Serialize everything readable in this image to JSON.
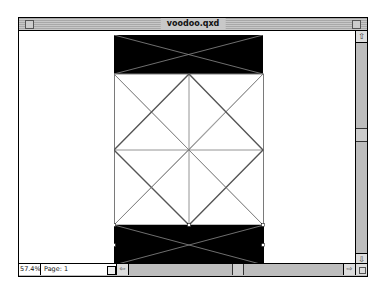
{
  "window": {
    "title": "voodoo.qxd"
  },
  "status_bar": {
    "zoom_level": "57.4%",
    "page_label": "Page: 1"
  },
  "scrollbars": {
    "vertical": {
      "up_arrow": "⇧",
      "down_arrow": "⇩"
    },
    "horizontal": {
      "left_arrow": "⇦",
      "right_arrow": "⇨"
    }
  },
  "document": {
    "colors": {
      "box_fill": "#000000",
      "line": "#7a7a7a",
      "page_bg": "#ffffff"
    },
    "items": [
      {
        "name": "top-picture-box",
        "type": "empty-picture-box",
        "fill": "black"
      },
      {
        "name": "middle-grid",
        "type": "line-grid"
      },
      {
        "name": "bottom-picture-box",
        "type": "empty-picture-box",
        "fill": "black",
        "selected": true
      }
    ]
  }
}
